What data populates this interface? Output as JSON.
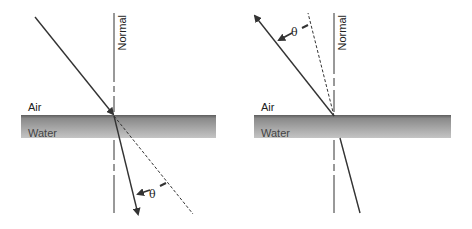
{
  "diagram": {
    "colors": {
      "ray": "#333333",
      "water_top": "#6a6a6a",
      "water_bottom": "#bdbdbd"
    },
    "panels": [
      {
        "id": "left",
        "normal_label": "Normal",
        "upper_medium_label": "Air",
        "lower_medium_label": "Water",
        "angle_label": "θ",
        "description": "Ray from air bends toward the normal entering water; dashed line shows undeviated path"
      },
      {
        "id": "right",
        "normal_label": "Normal",
        "upper_medium_label": "Air",
        "lower_medium_label": "Water",
        "angle_label": "θ",
        "description": "Ray from water bends away from the normal entering air; dashed line shows undeviated path"
      }
    ]
  }
}
